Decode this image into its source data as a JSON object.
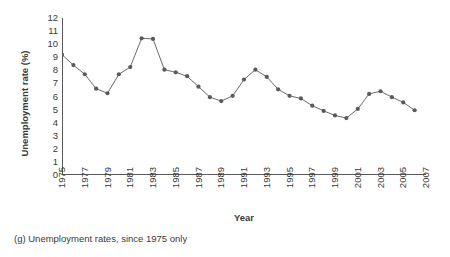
{
  "caption": "(g) Unemployment rates, since 1975 only",
  "chart_data": {
    "type": "line",
    "title": "",
    "xlabel": "Year",
    "ylabel": "Unemployment rate (%)",
    "xlim": [
      1975,
      2007
    ],
    "ylim": [
      0,
      12
    ],
    "ytick_step": 1,
    "xtick_step": 2,
    "grid": false,
    "legend": false,
    "marker": "circle",
    "line_color": "#6b6b6b",
    "marker_color": "#5a5a5a",
    "axis_color": "#5a5a5a",
    "yticks": [
      0,
      1,
      2,
      3,
      4,
      5,
      6,
      7,
      8,
      9,
      10,
      11,
      12
    ],
    "ytick_labels": [
      "0",
      "1",
      "2",
      "3",
      "4",
      "5",
      "6",
      "7",
      "8",
      "9",
      "10",
      "11",
      "12"
    ],
    "xticks": [
      1975,
      1977,
      1979,
      1981,
      1983,
      1985,
      1987,
      1989,
      1991,
      1993,
      1995,
      1997,
      1999,
      2001,
      2003,
      2005,
      2007
    ],
    "xtick_labels": [
      "1975",
      "1977",
      "1979",
      "1981",
      "1983",
      "1985",
      "1987",
      "1989",
      "1991",
      "1993",
      "1995",
      "1997",
      "1999",
      "2001",
      "2003",
      "2005",
      "2007"
    ],
    "x": [
      1975,
      1976,
      1977,
      1978,
      1979,
      1980,
      1981,
      1982,
      1983,
      1984,
      1985,
      1986,
      1987,
      1988,
      1989,
      1990,
      1991,
      1992,
      1993,
      1994,
      1995,
      1996,
      1997,
      1998,
      1999,
      2000,
      2001,
      2002,
      2003,
      2004,
      2005,
      2006
    ],
    "values": [
      9.2,
      8.4,
      7.7,
      6.6,
      6.25,
      7.7,
      8.25,
      10.45,
      10.4,
      8.05,
      7.85,
      7.55,
      6.75,
      5.95,
      5.65,
      6.05,
      7.3,
      8.05,
      7.5,
      6.55,
      6.05,
      5.85,
      5.3,
      4.9,
      4.55,
      4.35,
      5.05,
      6.2,
      6.4,
      5.95,
      5.55,
      4.95
    ],
    "series": [
      {
        "name": "Unemployment rate",
        "values": [
          9.2,
          8.4,
          7.7,
          6.6,
          6.25,
          7.7,
          8.25,
          10.45,
          10.4,
          8.05,
          7.85,
          7.55,
          6.75,
          5.95,
          5.65,
          6.05,
          7.3,
          8.05,
          7.5,
          6.55,
          6.05,
          5.85,
          5.3,
          4.9,
          4.55,
          4.35,
          5.05,
          6.2,
          6.4,
          5.95,
          5.55,
          4.95
        ]
      }
    ]
  }
}
